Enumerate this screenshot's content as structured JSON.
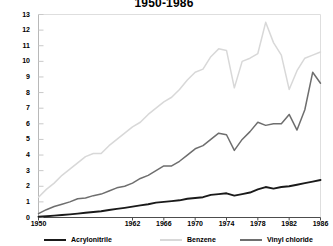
{
  "chart_data": {
    "type": "line",
    "title": "1950-1986",
    "xlabel": "",
    "ylabel": "",
    "xlim": [
      1950,
      1986
    ],
    "ylim": [
      0,
      13
    ],
    "grid": false,
    "legend_position": "bottom",
    "y_ticks": [
      0,
      1,
      2,
      3,
      4,
      5,
      6,
      7,
      8,
      9,
      10,
      11,
      12,
      13
    ],
    "x_ticks": [
      1950,
      1962,
      1966,
      1970,
      1974,
      1978,
      1982,
      1986
    ],
    "x": [
      1950,
      1951,
      1952,
      1953,
      1954,
      1955,
      1956,
      1957,
      1958,
      1959,
      1960,
      1961,
      1962,
      1963,
      1964,
      1965,
      1966,
      1967,
      1968,
      1969,
      1970,
      1971,
      1972,
      1973,
      1974,
      1975,
      1976,
      1977,
      1978,
      1979,
      1980,
      1981,
      1982,
      1983,
      1984,
      1985,
      1986
    ],
    "series": [
      {
        "name": "Acrylonitrile",
        "color": "#1a1a1a",
        "values": [
          0.05,
          0.08,
          0.12,
          0.16,
          0.2,
          0.25,
          0.3,
          0.35,
          0.4,
          0.48,
          0.55,
          0.62,
          0.7,
          0.78,
          0.85,
          0.95,
          1.0,
          1.05,
          1.1,
          1.2,
          1.25,
          1.3,
          1.45,
          1.5,
          1.55,
          1.4,
          1.5,
          1.6,
          1.8,
          1.95,
          1.85,
          1.95,
          2.0,
          2.1,
          2.2,
          2.3,
          2.4
        ]
      },
      {
        "name": "Benzene",
        "color": "#d8d8d8",
        "values": [
          1.3,
          1.8,
          2.2,
          2.7,
          3.1,
          3.5,
          3.9,
          4.1,
          4.1,
          4.6,
          5.0,
          5.4,
          5.8,
          6.1,
          6.6,
          7.0,
          7.4,
          7.7,
          8.2,
          8.8,
          9.3,
          9.5,
          10.3,
          10.8,
          10.7,
          8.3,
          10.0,
          10.2,
          10.5,
          12.5,
          11.2,
          10.4,
          8.2,
          9.4,
          10.2,
          10.4,
          10.6
        ]
      },
      {
        "name": "Vinyl chloride",
        "color": "#6e6e6e",
        "values": [
          0.25,
          0.5,
          0.7,
          0.85,
          1.0,
          1.2,
          1.25,
          1.4,
          1.5,
          1.7,
          1.9,
          2.0,
          2.2,
          2.5,
          2.7,
          3.0,
          3.3,
          3.3,
          3.6,
          4.0,
          4.4,
          4.6,
          5.0,
          5.4,
          5.3,
          4.3,
          5.0,
          5.5,
          6.1,
          5.9,
          6.0,
          6.0,
          6.6,
          5.6,
          6.9,
          9.3,
          8.6
        ]
      }
    ]
  },
  "legend": {
    "items": [
      {
        "label": "Acrylonitrile",
        "color": "#1a1a1a"
      },
      {
        "label": "Benzene",
        "color": "#d8d8d8"
      },
      {
        "label": "Vinyl chloride",
        "color": "#6e6e6e"
      }
    ]
  }
}
